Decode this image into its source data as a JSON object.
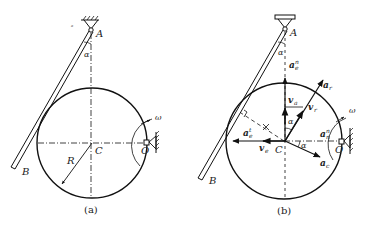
{
  "figure": {
    "panels": [
      {
        "id": "a",
        "caption": "(a)",
        "labels": {
          "A": "A",
          "B": "B",
          "C": "C",
          "O": "O",
          "R": "R",
          "alpha": "α",
          "omega": "ω"
        }
      },
      {
        "id": "b",
        "caption": "(b)",
        "labels": {
          "A": "A",
          "B": "B",
          "C": "C",
          "O": "O",
          "alpha_top": "α",
          "alpha_mid": "α",
          "alpha_right": "α",
          "omega": "ω",
          "a_e_n": "a",
          "a_e_n_sub": "e",
          "a_e_n_sup": "n",
          "a_r": "a",
          "a_r_sub": "r",
          "v_a": "v",
          "v_a_sub": "a",
          "v_r": "v",
          "v_r_sub": "r",
          "v_e": "v",
          "v_e_sub": "e",
          "a_e_t": "a",
          "a_e_t_sub": "e",
          "a_e_t_sup": "t",
          "a_n": "a",
          "a_n_sub": "n",
          "a_n_sup": "n",
          "a_c": "a",
          "a_c_sub": "c"
        }
      }
    ]
  }
}
